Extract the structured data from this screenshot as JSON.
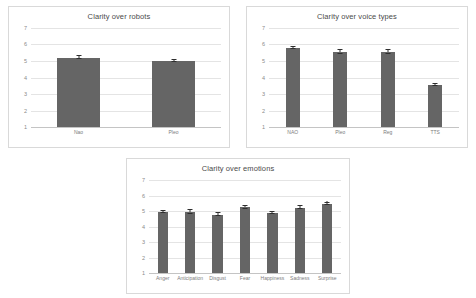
{
  "chart_data": [
    {
      "id": "robots",
      "type": "bar",
      "title": "Clarity over robots",
      "xlabel": "",
      "ylabel": "",
      "ylim": [
        1,
        7
      ],
      "yticks": [
        1,
        2,
        3,
        4,
        5,
        6,
        7
      ],
      "grid": true,
      "legend": "none",
      "bar_color": "#656565",
      "bar_width_ratio": 0.46,
      "categories": [
        "Nao",
        "Pleo"
      ],
      "values": [
        5.2,
        5.0
      ],
      "errors": [
        0.12,
        0.1
      ]
    },
    {
      "id": "voices",
      "type": "bar",
      "title": "Clarity over voice types",
      "xlabel": "",
      "ylabel": "",
      "ylim": [
        1,
        7
      ],
      "yticks": [
        1,
        2,
        3,
        4,
        5,
        6,
        7
      ],
      "grid": true,
      "legend": "none",
      "bar_color": "#656565",
      "bar_width_ratio": 0.3,
      "categories": [
        "NAO",
        "Pleo",
        "Reg",
        "TTS"
      ],
      "values": [
        5.8,
        5.55,
        5.55,
        3.55
      ],
      "errors": [
        0.08,
        0.13,
        0.15,
        0.12
      ]
    },
    {
      "id": "emotions",
      "type": "bar",
      "title": "Clarity over emotions",
      "xlabel": "",
      "ylabel": "",
      "ylim": [
        1,
        7
      ],
      "yticks": [
        1,
        2,
        3,
        4,
        5,
        6,
        7
      ],
      "grid": true,
      "legend": "none",
      "bar_color": "#656565",
      "bar_width_ratio": 0.38,
      "categories": [
        "Anger",
        "Anticipation",
        "Disgust",
        "Fear",
        "Happiness",
        "Sadness",
        "Surprise"
      ],
      "values": [
        4.95,
        4.95,
        4.75,
        5.25,
        4.85,
        5.2,
        5.45
      ],
      "errors": [
        0.12,
        0.17,
        0.15,
        0.13,
        0.1,
        0.14,
        0.12
      ]
    }
  ]
}
